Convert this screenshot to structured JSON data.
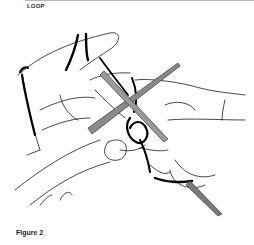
{
  "page": {
    "section_heading": "LOOP",
    "figure_caption": "Figure 2"
  },
  "illustration": {
    "subject": "hands-knitting-loop-icon",
    "description": "Line drawing of two hands holding crossed knitting needles with yarn wrapped around the left index finger",
    "colors": {
      "outline": "#1a1a1a",
      "yarn": "#000000",
      "needle": "#6e6e6e",
      "background": "#ffffff"
    }
  }
}
